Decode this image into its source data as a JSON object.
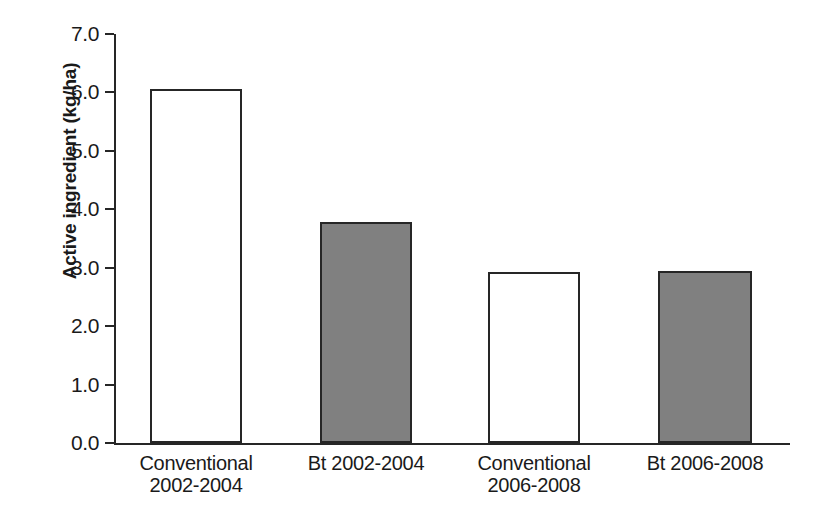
{
  "chart_data": {
    "type": "bar",
    "title": "",
    "subtitle": "",
    "xlabel": "",
    "ylabel": "Active ingredient (kg/ha)",
    "categories": [
      "Conventional 2002-2004",
      "Bt 2002-2004",
      "Conventional 2006-2008",
      "Bt 2006-2008"
    ],
    "category_lines": [
      [
        "Conventional",
        "2002-2004"
      ],
      [
        "Bt 2002-2004",
        ""
      ],
      [
        "Conventional",
        "2006-2008"
      ],
      [
        "Bt 2006-2008",
        ""
      ]
    ],
    "values": [
      6.06,
      3.79,
      2.92,
      2.95
    ],
    "bar_styles": [
      "open",
      "filled",
      "open",
      "filled"
    ],
    "ylim": [
      0.0,
      7.0
    ],
    "ytick_labels": [
      "0.0",
      "1.0",
      "2.0",
      "3.0",
      "4.0",
      "5.0",
      "6.0",
      "7.0"
    ],
    "ytick_values": [
      0.0,
      1.0,
      2.0,
      3.0,
      4.0,
      5.0,
      6.0,
      7.0
    ],
    "grid": false,
    "legend": "none",
    "colors": {
      "axis": "#262626",
      "bar_outline": "#262626",
      "bar_fill_open": "#ffffff",
      "bar_fill_solid": "#808080",
      "background": "#ffffff",
      "text": "#1a1a1a"
    }
  }
}
